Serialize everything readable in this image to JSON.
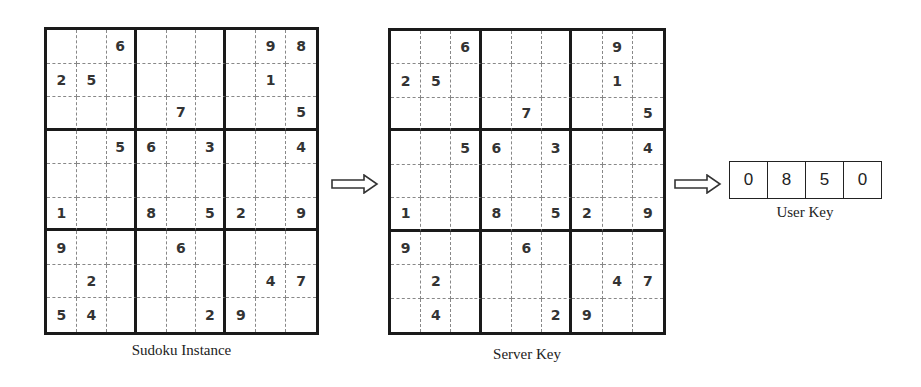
{
  "sudoku_instance": {
    "caption": "Sudoku Instance",
    "rows": [
      [
        "",
        "",
        "6",
        "",
        "",
        "",
        "",
        "9",
        "8"
      ],
      [
        "2",
        "5",
        "",
        "",
        "",
        "",
        "",
        "1",
        ""
      ],
      [
        "",
        "",
        "",
        "",
        "7",
        "",
        "",
        "",
        "5"
      ],
      [
        "",
        "",
        "5",
        "6",
        "",
        "3",
        "",
        "",
        "4"
      ],
      [
        "",
        "",
        "",
        "",
        "",
        "",
        "",
        "",
        ""
      ],
      [
        "1",
        "",
        "",
        "8",
        "",
        "5",
        "2",
        "",
        "9"
      ],
      [
        "9",
        "",
        "",
        "",
        "6",
        "",
        "",
        "",
        ""
      ],
      [
        "",
        "2",
        "",
        "",
        "",
        "",
        "",
        "4",
        "7"
      ],
      [
        "5",
        "4",
        "",
        "",
        "",
        "2",
        "9",
        "",
        ""
      ]
    ]
  },
  "server_key": {
    "caption": "Server Key",
    "rows": [
      [
        "",
        "",
        "6",
        "",
        "",
        "",
        "",
        "9",
        ""
      ],
      [
        "2",
        "5",
        "",
        "",
        "",
        "",
        "",
        "1",
        ""
      ],
      [
        "",
        "",
        "",
        "",
        "7",
        "",
        "",
        "",
        "5"
      ],
      [
        "",
        "",
        "5",
        "6",
        "",
        "3",
        "",
        "",
        "4"
      ],
      [
        "",
        "",
        "",
        "",
        "",
        "",
        "",
        "",
        ""
      ],
      [
        "1",
        "",
        "",
        "8",
        "",
        "5",
        "2",
        "",
        "9"
      ],
      [
        "9",
        "",
        "",
        "",
        "6",
        "",
        "",
        "",
        ""
      ],
      [
        "",
        "2",
        "",
        "",
        "",
        "",
        "",
        "4",
        "7"
      ],
      [
        "",
        "4",
        "",
        "",
        "",
        "2",
        "9",
        "",
        ""
      ]
    ]
  },
  "user_key": {
    "caption": "User Key",
    "digits": [
      "0",
      "8",
      "5",
      "0"
    ]
  },
  "arrows": [
    "instance-to-server-key",
    "server-key-to-user-key"
  ]
}
